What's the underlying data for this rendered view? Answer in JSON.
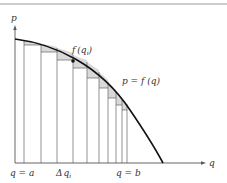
{
  "figure": {
    "type": "riemann-sum-diagram",
    "colors": {
      "axis": "#555555",
      "curve": "#111111",
      "rect_lines": "#666666",
      "shade": "#d9d9d9",
      "top_rule": "#9a9a9a"
    },
    "labels": {
      "y_axis": "p",
      "x_axis": "q",
      "point_label_f": "f",
      "point_label_open": "(",
      "point_label_q": "q",
      "point_label_sub": "i",
      "point_label_close": ")",
      "curve_label": "p = f (q)",
      "left_bound": "q = a",
      "delta_delta": "Δ",
      "delta_q": "q",
      "delta_sub": "i",
      "right_bound": "q = b"
    },
    "partition_x": [
      15,
      24,
      41,
      57,
      73,
      87,
      99,
      108,
      116,
      122,
      127
    ],
    "rect_tops_y": [
      45,
      52,
      60,
      68,
      78,
      88,
      98,
      105,
      110,
      114
    ],
    "curve": {
      "start": [
        15,
        39
      ],
      "end": [
        163,
        163
      ]
    },
    "highlight_point": [
      73,
      61
    ]
  }
}
